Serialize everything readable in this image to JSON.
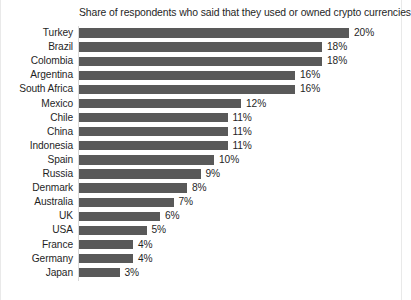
{
  "chart_data": {
    "type": "bar",
    "orientation": "horizontal",
    "title": "Share of respondents who said that they used or owned crypto currencies",
    "xlabel": "",
    "ylabel": "",
    "xlim": [
      0,
      20
    ],
    "grid": false,
    "legend": null,
    "value_suffix": "%",
    "bar_color": "#595959",
    "text_color": "#1f1f1f",
    "background_color": "#ffffff",
    "categories": [
      "Turkey",
      "Brazil",
      "Colombia",
      "Argentina",
      "South Africa",
      "Mexico",
      "Chile",
      "China",
      "Indonesia",
      "Spain",
      "Russia",
      "Denmark",
      "Australia",
      "UK",
      "USA",
      "France",
      "Germany",
      "Japan"
    ],
    "values": [
      20,
      18,
      18,
      16,
      16,
      12,
      11,
      11,
      11,
      10,
      9,
      8,
      7,
      6,
      5,
      4,
      4,
      3
    ],
    "data_labels": [
      "20%",
      "18%",
      "18%",
      "16%",
      "16%",
      "12%",
      "11%",
      "11%",
      "11%",
      "10%",
      "9%",
      "8%",
      "7%",
      "6%",
      "5%",
      "4%",
      "4%",
      "3%"
    ]
  }
}
